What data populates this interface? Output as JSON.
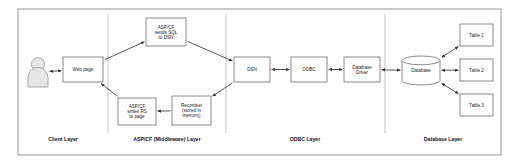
{
  "diagram": {
    "frame": {
      "x": 18,
      "y": 9,
      "width": 483,
      "height": 146
    },
    "colors": {
      "background": "#ffffff",
      "frame_stroke": "#8a8a8a",
      "node_stroke": "#6d6d6d",
      "divider_stroke": "#a9a9a9",
      "arrow_stroke": "#2b2b2b",
      "person_fill": "#e6e6e6",
      "text": "#1a1a1a"
    },
    "layers": [
      {
        "id": "client",
        "label": "Client Layer",
        "label_x": 63,
        "label_y": 141
      },
      {
        "id": "middleware",
        "label": "ASP/CF (Middleware) Layer",
        "label_x": 167,
        "label_y": 141
      },
      {
        "id": "odbc",
        "label": "ODBC Layer",
        "label_x": 305,
        "label_y": 141
      },
      {
        "id": "database",
        "label": "Database Layer",
        "label_x": 443,
        "label_y": 141
      }
    ],
    "dividers": [
      {
        "id": "divider-client-middleware",
        "x": 108
      },
      {
        "id": "divider-middleware-odbc",
        "x": 226
      },
      {
        "id": "divider-odbc-database",
        "x": 385
      }
    ],
    "nodes": [
      {
        "id": "user",
        "name": "user-actor-icon",
        "shape": "person",
        "x": 28,
        "y": 57,
        "width": 20,
        "height": 30,
        "lines": []
      },
      {
        "id": "web-page",
        "name": "web-page-box",
        "shape": "rect",
        "x": 63,
        "y": 57,
        "width": 40,
        "height": 25,
        "lines": [
          "Web page"
        ]
      },
      {
        "id": "asp-sends-sql",
        "name": "asp-sends-sql-box",
        "shape": "rect",
        "x": 146,
        "y": 18,
        "width": 40,
        "height": 28,
        "lines": [
          "ASP/CF",
          "sends SQL",
          "to DSN"
        ]
      },
      {
        "id": "asp-writes-rs",
        "name": "asp-writes-rs-box",
        "shape": "rect",
        "x": 118,
        "y": 98,
        "width": 38,
        "height": 27,
        "lines": [
          "ASP/CF",
          "writes RS",
          "to page"
        ]
      },
      {
        "id": "recordset",
        "name": "recordset-box",
        "shape": "rect",
        "x": 172,
        "y": 96,
        "width": 39,
        "height": 29,
        "lines": [
          "Recordset",
          "(stored in",
          "memory)"
        ]
      },
      {
        "id": "dsn",
        "name": "dsn-box",
        "shape": "rect",
        "x": 234,
        "y": 57,
        "width": 36,
        "height": 25,
        "lines": [
          "DSN"
        ]
      },
      {
        "id": "odbc",
        "name": "odbc-box",
        "shape": "rect",
        "x": 291,
        "y": 57,
        "width": 36,
        "height": 25,
        "lines": [
          "ODBC"
        ]
      },
      {
        "id": "database-driver",
        "name": "database-driver-box",
        "shape": "rect",
        "x": 344,
        "y": 57,
        "width": 36,
        "height": 25,
        "lines": [
          "Database",
          "Driver"
        ]
      },
      {
        "id": "database",
        "name": "database-cylinder",
        "shape": "cylinder",
        "x": 402,
        "y": 56,
        "width": 38,
        "height": 29,
        "lines": [
          "Database"
        ]
      },
      {
        "id": "table-1",
        "name": "table-1-box",
        "shape": "rect",
        "x": 460,
        "y": 24,
        "width": 33,
        "height": 22,
        "lines": [
          "Table 1"
        ]
      },
      {
        "id": "table-2",
        "name": "table-2-box",
        "shape": "rect",
        "x": 460,
        "y": 59,
        "width": 33,
        "height": 22,
        "lines": [
          "Table 2"
        ]
      },
      {
        "id": "table-3",
        "name": "table-3-box",
        "shape": "rect",
        "x": 460,
        "y": 94,
        "width": 33,
        "height": 22,
        "lines": [
          "Table 3"
        ]
      }
    ],
    "connectors": [
      {
        "id": "user-webpage",
        "name": "connector-user-to-web-page",
        "from": "user",
        "to": "web-page",
        "arrows": "both"
      },
      {
        "id": "webpage-asp-sql",
        "name": "connector-web-page-to-asp-sends-sql",
        "from": "web-page",
        "to": "asp-sends-sql",
        "arrows": "end"
      },
      {
        "id": "asp-sql-dsn",
        "name": "connector-asp-sends-sql-to-dsn",
        "from": "asp-sends-sql",
        "to": "dsn",
        "arrows": "end"
      },
      {
        "id": "dsn-recordset",
        "name": "connector-dsn-to-recordset",
        "from": "dsn",
        "to": "recordset",
        "arrows": "end"
      },
      {
        "id": "recordset-asp-rs",
        "name": "connector-recordset-to-asp-writes-rs",
        "from": "recordset",
        "to": "asp-writes-rs",
        "arrows": "end"
      },
      {
        "id": "asp-rs-webpage",
        "name": "connector-asp-writes-rs-to-web-page",
        "from": "asp-writes-rs",
        "to": "web-page",
        "arrows": "end"
      },
      {
        "id": "dsn-odbc",
        "name": "connector-dsn-to-odbc",
        "from": "dsn",
        "to": "odbc",
        "arrows": "both"
      },
      {
        "id": "odbc-driver",
        "name": "connector-odbc-to-database-driver",
        "from": "odbc",
        "to": "database-driver",
        "arrows": "both"
      },
      {
        "id": "driver-database",
        "name": "connector-database-driver-to-database",
        "from": "database-driver",
        "to": "database",
        "arrows": "both"
      },
      {
        "id": "database-table-1",
        "name": "connector-database-to-table-1",
        "from": "database",
        "to": "table-1",
        "arrows": "both"
      },
      {
        "id": "database-table-2",
        "name": "connector-database-to-table-2",
        "from": "database",
        "to": "table-2",
        "arrows": "both"
      },
      {
        "id": "database-table-3",
        "name": "connector-database-to-table-3",
        "from": "database",
        "to": "table-3",
        "arrows": "both"
      }
    ]
  }
}
